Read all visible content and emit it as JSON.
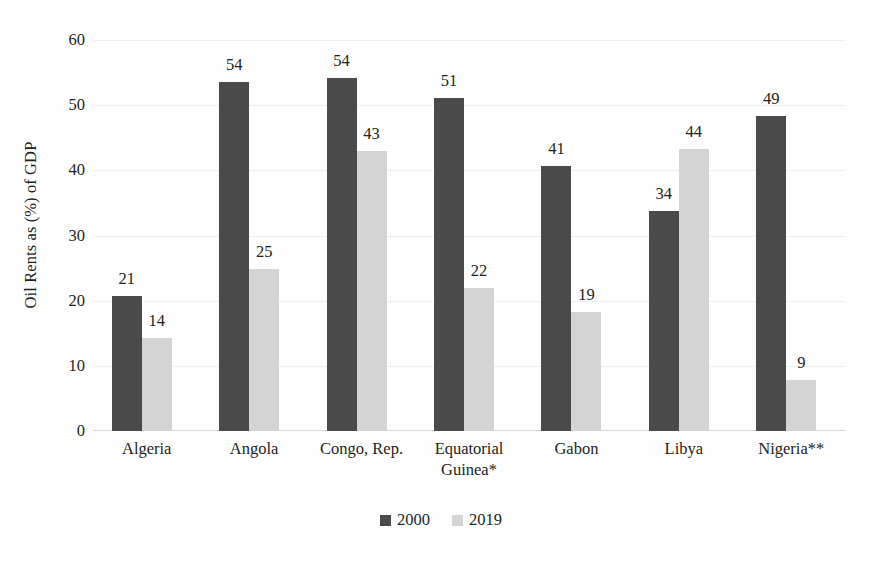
{
  "chart_data": {
    "type": "bar",
    "title": "",
    "subtitle": "",
    "xlabel": "",
    "ylabel": "Oil Rents as (%) of GDP",
    "ylim": [
      0,
      60
    ],
    "ytick_labels": [
      "60",
      "50",
      "40",
      "30",
      "20",
      "10",
      "0"
    ],
    "ytick_values": [
      60,
      50,
      40,
      30,
      20,
      10,
      0
    ],
    "grid": true,
    "grid_axis": "y",
    "legend_position": "bottom-center",
    "categories": [
      "Algeria",
      "Angola",
      "Congo, Rep.",
      "Equatorial Guinea*",
      "Gabon",
      "Libya",
      "Nigeria**"
    ],
    "category_lines": [
      [
        "Algeria"
      ],
      [
        "Angola"
      ],
      [
        "Congo, Rep."
      ],
      [
        "Equatorial",
        "Guinea*"
      ],
      [
        "Gabon"
      ],
      [
        "Libya"
      ],
      [
        "Nigeria**"
      ]
    ],
    "series": [
      {
        "name": "2000",
        "color": "#4a4a4a",
        "values": [
          21,
          54,
          54,
          51,
          41,
          34,
          49
        ],
        "plotted": [
          20.7,
          53.6,
          54.1,
          51.1,
          40.6,
          33.8,
          48.4
        ],
        "labels": [
          "21",
          "54",
          "54",
          "51",
          "41",
          "34",
          "49"
        ]
      },
      {
        "name": "2019",
        "color": "#d4d4d4",
        "values": [
          14,
          25,
          43,
          22,
          19,
          44,
          9
        ],
        "plotted": [
          14.2,
          24.8,
          43.0,
          21.9,
          18.3,
          43.3,
          7.8
        ],
        "labels": [
          "14",
          "25",
          "43",
          "22",
          "19",
          "44",
          "9"
        ]
      }
    ]
  },
  "legend": {
    "items": [
      {
        "label": "2000",
        "color": "#4a4a4a"
      },
      {
        "label": "2019",
        "color": "#d4d4d4"
      }
    ]
  },
  "axis": {
    "y_title": "Oil Rents as (%) of GDP"
  },
  "colors": {
    "series_2000": "#4a4a4a",
    "series_2019": "#d4d4d4",
    "text": "#231f20",
    "gridline": "#efefef",
    "background": "#ffffff"
  }
}
